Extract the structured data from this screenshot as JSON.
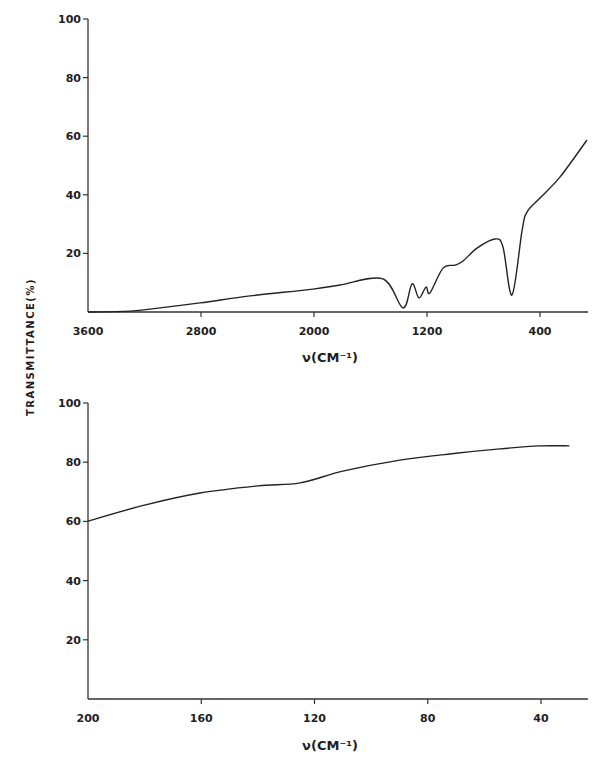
{
  "figure": {
    "ylabel": "TRANSMITTANCE(%)",
    "colors": {
      "line": "#222222",
      "axis": "#333333",
      "background": "#ffffff"
    }
  },
  "chart_data": [
    {
      "type": "line",
      "title": "",
      "xlabel": "ν(CM⁻¹)",
      "ylabel": "TRANSMITTANCE(%)",
      "xlim": [
        3600,
        60
      ],
      "ylim": [
        0,
        100
      ],
      "x_ticks": [
        3600,
        2800,
        2000,
        1200,
        400
      ],
      "y_ticks": [
        20,
        40,
        60,
        80,
        100
      ],
      "grid": false,
      "legend": null,
      "series": [
        {
          "name": "IR spectrum (mid-IR)",
          "x": [
            3600,
            3303,
            3161,
            2807,
            2453,
            2007,
            1816,
            1512,
            1370,
            1306,
            1257,
            1207,
            1179,
            1087,
            1002,
            945,
            846,
            719,
            662,
            598,
            527,
            492,
            400,
            258,
            67
          ],
          "y": [
            0.0,
            0.3,
            1.0,
            3.1,
            5.5,
            7.8,
            9.2,
            11.3,
            1.4,
            9.6,
            4.8,
            8.5,
            6.5,
            15.0,
            16.0,
            17.4,
            21.8,
            24.9,
            22.2,
            5.8,
            27.9,
            34.1,
            38.9,
            46.1,
            58.7
          ]
        }
      ]
    },
    {
      "type": "line",
      "title": "",
      "xlabel": "ν(CM⁻¹)",
      "ylabel": "TRANSMITTANCE(%)",
      "xlim": [
        200,
        30
      ],
      "ylim": [
        0,
        100
      ],
      "x_ticks": [
        200,
        160,
        120,
        80,
        40
      ],
      "y_ticks": [
        20,
        40,
        60,
        80,
        100
      ],
      "grid": false,
      "legend": null,
      "series": [
        {
          "name": "IR spectrum (far-IR)",
          "x": [
            200,
            180,
            160.4,
            140,
            125.1,
            110,
            89.8,
            70,
            54.5,
            40.3,
            30
          ],
          "y": [
            60.1,
            65.5,
            69.6,
            72.0,
            73.0,
            77.0,
            80.7,
            83.0,
            84.5,
            85.5,
            85.5
          ]
        }
      ]
    }
  ]
}
